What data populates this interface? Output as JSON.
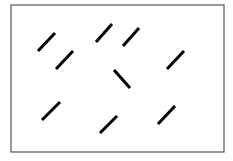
{
  "diagram": {
    "type": "visual-search-stimulus",
    "frame": {
      "x": 11,
      "y": 5,
      "width": 213,
      "height": 147,
      "stroke": "#555555"
    },
    "line_color": "#000000",
    "segments": [
      {
        "id": "a",
        "x1": 38,
        "y1": 51,
        "x2": 55,
        "y2": 33,
        "orientation": "right-tilt"
      },
      {
        "id": "b",
        "x1": 56,
        "y1": 69,
        "x2": 73,
        "y2": 51,
        "orientation": "right-tilt"
      },
      {
        "id": "c",
        "x1": 96,
        "y1": 42,
        "x2": 112,
        "y2": 24,
        "orientation": "right-tilt"
      },
      {
        "id": "d",
        "x1": 123,
        "y1": 46,
        "x2": 139,
        "y2": 28,
        "orientation": "right-tilt"
      },
      {
        "id": "e",
        "x1": 167,
        "y1": 69,
        "x2": 184,
        "y2": 51,
        "orientation": "right-tilt"
      },
      {
        "id": "f",
        "x1": 114,
        "y1": 70,
        "x2": 130,
        "y2": 88,
        "orientation": "left-tilt",
        "odd_one_out": true
      },
      {
        "id": "g",
        "x1": 42,
        "y1": 120,
        "x2": 60,
        "y2": 102,
        "orientation": "right-tilt"
      },
      {
        "id": "h",
        "x1": 100,
        "y1": 133,
        "x2": 117,
        "y2": 116,
        "orientation": "right-tilt"
      },
      {
        "id": "i",
        "x1": 158,
        "y1": 124,
        "x2": 175,
        "y2": 106,
        "orientation": "right-tilt"
      }
    ]
  }
}
